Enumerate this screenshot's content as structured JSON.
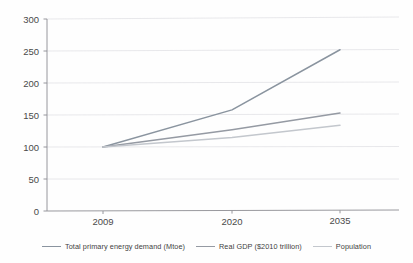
{
  "chart_data": {
    "type": "line",
    "title": "",
    "subtitle": "",
    "xlabel": "",
    "ylabel": "",
    "categories": [
      "2009",
      "2020",
      "2035"
    ],
    "x_tick_labels": [
      "2009",
      "2020",
      "2035"
    ],
    "y_tick_labels": [
      "0",
      "50",
      "100",
      "150",
      "200",
      "250",
      "300"
    ],
    "y_ticks": [
      0,
      50,
      100,
      150,
      200,
      250,
      300
    ],
    "ylim": [
      0,
      300
    ],
    "grid": "horizontal",
    "legend_position": "bottom",
    "series": [
      {
        "name": "Total primary energy demand (Mtoe)",
        "values": [
          100,
          158,
          252
        ],
        "color": "#8a949f"
      },
      {
        "name": "Real GDP ($2010 trillion)",
        "values": [
          100,
          127,
          153
        ],
        "color": "#959aa3"
      },
      {
        "name": "Population",
        "values": [
          100,
          115,
          134
        ],
        "color": "#c3c7cd"
      }
    ]
  },
  "legend": {
    "items": [
      {
        "label": "Total primary energy demand (Mtoe)",
        "color": "#8a949f"
      },
      {
        "label": "Real GDP ($2010 trillion)",
        "color": "#959aa3"
      },
      {
        "label": "Population",
        "color": "#c3c7cd"
      }
    ]
  },
  "axes": {
    "y": {
      "labels": [
        "300",
        "250",
        "200",
        "150",
        "100",
        "50",
        "0"
      ]
    },
    "x": {
      "labels": [
        "2009",
        "2020",
        "2035"
      ]
    }
  },
  "colors": {
    "gridline": "#e2e2e6",
    "axis": "#8d8d93",
    "text": "#4a4a4a",
    "background": "#fefefe"
  }
}
